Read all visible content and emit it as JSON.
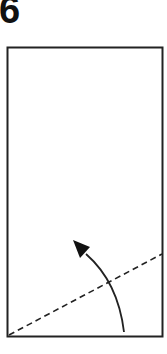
{
  "step": {
    "number": "6"
  },
  "diagram": {
    "paper": {
      "x": 7.5,
      "y": 47.5,
      "width": 155,
      "height": 289,
      "stroke": "#222222"
    },
    "fold_line": {
      "x1": 9,
      "y1": 335,
      "x2": 162,
      "y2": 254,
      "style": "dashed",
      "stroke": "#222222"
    },
    "fold_arrow": {
      "path": "M124,332 Q118,278 78,247",
      "direction": "up-left",
      "stroke": "#222222",
      "icon": "curved-arrow-icon"
    }
  }
}
